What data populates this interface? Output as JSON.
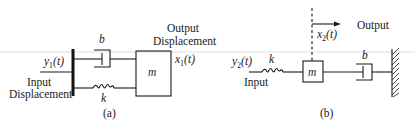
{
  "figure": {
    "background": "#ffffff",
    "ink_color": "#1a1a1a",
    "panel_a": {
      "caption": "(a)",
      "damper_label": "b",
      "spring_label": "k",
      "mass_label": "m",
      "input_var": "y",
      "input_sub": "1",
      "input_arg": "(t)",
      "input_label_line1": "Input",
      "input_label_line2": "Displacement",
      "output_label_line1": "Output",
      "output_label_line2": "Displacement",
      "output_var": "x",
      "output_sub": "1",
      "output_arg": "(t)"
    },
    "panel_b": {
      "caption": "(b)",
      "damper_label": "b",
      "spring_label": "k",
      "mass_label": "m",
      "input_var": "y",
      "input_sub": "2",
      "input_arg": "(t)",
      "input_label": "Input",
      "output_label": "Output",
      "output_var": "x",
      "output_sub": "2",
      "output_arg": "(t)"
    }
  }
}
